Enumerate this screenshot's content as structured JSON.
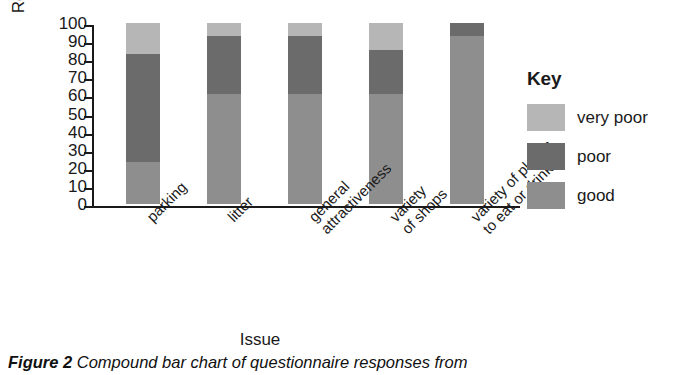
{
  "chart_data": {
    "type": "bar",
    "subtype": "stacked-100-percent",
    "title": "",
    "xlabel": "Issue",
    "ylabel": "Respondents (%)",
    "ylim": [
      0,
      100
    ],
    "ytick_step": 10,
    "yticks": [
      0,
      10,
      20,
      30,
      40,
      50,
      60,
      70,
      80,
      90,
      100
    ],
    "ytick_labels": [
      "0",
      "10",
      "20",
      "30",
      "40",
      "50",
      "60",
      "70",
      "80",
      "90",
      "100"
    ],
    "grid": false,
    "legend_position": "right",
    "legend_title": "Key",
    "categories": [
      "parking",
      "litter",
      "general attractiveness",
      "variety of shops",
      "variety of places to eat or drink"
    ],
    "category_lines": [
      [
        "parking"
      ],
      [
        "litter"
      ],
      [
        "general",
        "attractiveness"
      ],
      [
        "variety",
        "of shops"
      ],
      [
        "variety of places",
        "to eat or drink"
      ]
    ],
    "series": [
      {
        "name": "good",
        "color": "#8e8e8e",
        "values": [
          23,
          61,
          61,
          61,
          93
        ]
      },
      {
        "name": "poor",
        "color": "#6b6b6b",
        "values": [
          60,
          32,
          32,
          24,
          7
        ]
      },
      {
        "name": "very poor",
        "color": "#b6b6b6",
        "values": [
          17,
          7,
          7,
          15,
          0
        ]
      }
    ],
    "stack_order_bottom_to_top": [
      "good",
      "poor",
      "very poor"
    ],
    "legend_order_top_to_bottom": [
      "very poor",
      "poor",
      "good"
    ]
  },
  "caption": {
    "figure_label": "Figure 2",
    "text": " Compound bar chart of questionnaire responses from"
  }
}
